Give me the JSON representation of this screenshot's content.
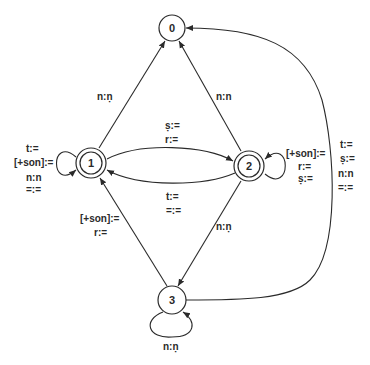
{
  "diagram": {
    "type": "finite-state transducer",
    "nodes": [
      {
        "id": "0",
        "label": "0",
        "final": false
      },
      {
        "id": "1",
        "label": "1",
        "final": true
      },
      {
        "id": "2",
        "label": "2",
        "final": true
      },
      {
        "id": "3",
        "label": "3",
        "final": false
      }
    ],
    "edges": {
      "e1_0": {
        "from": "1",
        "to": "0",
        "labels": [
          "n:ṇ"
        ]
      },
      "e2_0": {
        "from": "2",
        "to": "0",
        "labels": [
          "n:n"
        ]
      },
      "e1_2": {
        "from": "1",
        "to": "2",
        "labels": [
          "ṣ:=",
          "r:="
        ]
      },
      "e2_1": {
        "from": "2",
        "to": "1",
        "labels": [
          "t:=",
          "=:="
        ]
      },
      "e1_1": {
        "from": "1",
        "to": "1",
        "labels": [
          "t:=",
          "[+son]:=",
          "n:n",
          "=:="
        ]
      },
      "e2_2": {
        "from": "2",
        "to": "2",
        "labels": [
          "[+son]:=",
          "r:=",
          "ṣ:="
        ]
      },
      "e2_3": {
        "from": "2",
        "to": "3",
        "labels": [
          "n:ṇ"
        ]
      },
      "e3_1": {
        "from": "3",
        "to": "1",
        "labels": [
          "[+son]:=",
          "r:="
        ]
      },
      "e3_3": {
        "from": "3",
        "to": "3",
        "labels": [
          "n:ṇ"
        ]
      },
      "e3_0": {
        "from": "3",
        "to": "0",
        "labels": [
          "t:=",
          "ṣ:=",
          "n:n",
          "=:="
        ]
      }
    }
  }
}
